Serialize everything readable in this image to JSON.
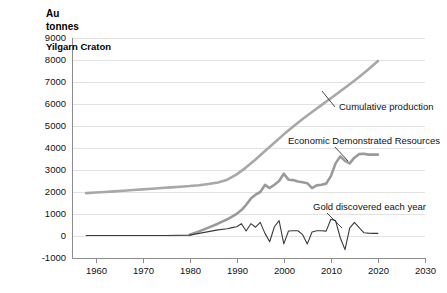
{
  "chart_data": {
    "type": "line",
    "title": "Au tonnes",
    "subtitle": "Yilgarn Craton",
    "xlabel": "",
    "ylabel": "Au tonnes",
    "xlim": [
      1955,
      2030
    ],
    "ylim": [
      -1000,
      9000
    ],
    "grid": true,
    "legend_position": "inline-annotations",
    "x_ticks": [
      1960,
      1970,
      1980,
      1990,
      2000,
      2010,
      2020,
      2030
    ],
    "y_ticks": [
      -1000,
      0,
      1000,
      2000,
      3000,
      4000,
      5000,
      6000,
      7000,
      8000,
      9000
    ],
    "series": [
      {
        "name": "Cumulative production",
        "color": "#a8a8a8",
        "width": 2.6,
        "annotation": "Cumulative production",
        "points": [
          [
            1958,
            1950
          ],
          [
            1960,
            1975
          ],
          [
            1962,
            2000
          ],
          [
            1964,
            2030
          ],
          [
            1966,
            2060
          ],
          [
            1968,
            2090
          ],
          [
            1970,
            2120
          ],
          [
            1972,
            2150
          ],
          [
            1974,
            2180
          ],
          [
            1976,
            2210
          ],
          [
            1978,
            2240
          ],
          [
            1980,
            2270
          ],
          [
            1982,
            2310
          ],
          [
            1984,
            2360
          ],
          [
            1986,
            2430
          ],
          [
            1988,
            2560
          ],
          [
            1990,
            2800
          ],
          [
            1992,
            3120
          ],
          [
            1994,
            3480
          ],
          [
            1996,
            3860
          ],
          [
            1998,
            4240
          ],
          [
            2000,
            4620
          ],
          [
            2002,
            4980
          ],
          [
            2004,
            5320
          ],
          [
            2006,
            5640
          ],
          [
            2008,
            5950
          ],
          [
            2010,
            6260
          ],
          [
            2012,
            6580
          ],
          [
            2014,
            6900
          ],
          [
            2016,
            7230
          ],
          [
            2018,
            7580
          ],
          [
            2020,
            7950
          ]
        ]
      },
      {
        "name": "Economic Demonstrated Resources",
        "color": "#9a9a9a",
        "width": 2.6,
        "annotation": "Economic Demonstrated Resources",
        "points": [
          [
            1980,
            60
          ],
          [
            1982,
            210
          ],
          [
            1984,
            380
          ],
          [
            1986,
            560
          ],
          [
            1988,
            760
          ],
          [
            1990,
            1010
          ],
          [
            1991,
            1180
          ],
          [
            1992,
            1420
          ],
          [
            1993,
            1700
          ],
          [
            1994,
            1880
          ],
          [
            1995,
            2000
          ],
          [
            1996,
            2320
          ],
          [
            1997,
            2180
          ],
          [
            1998,
            2330
          ],
          [
            1999,
            2500
          ],
          [
            2000,
            2830
          ],
          [
            2001,
            2560
          ],
          [
            2002,
            2540
          ],
          [
            2003,
            2480
          ],
          [
            2004,
            2440
          ],
          [
            2005,
            2400
          ],
          [
            2006,
            2180
          ],
          [
            2007,
            2300
          ],
          [
            2008,
            2330
          ],
          [
            2009,
            2380
          ],
          [
            2010,
            2720
          ],
          [
            2011,
            3300
          ],
          [
            2012,
            3620
          ],
          [
            2013,
            3420
          ],
          [
            2014,
            3300
          ],
          [
            2015,
            3560
          ],
          [
            2016,
            3720
          ],
          [
            2017,
            3740
          ],
          [
            2018,
            3700
          ],
          [
            2019,
            3700
          ],
          [
            2020,
            3700
          ]
        ]
      },
      {
        "name": "Gold discovered each year",
        "color": "#3a3a3a",
        "width": 1.1,
        "annotation": "Gold discovered each year",
        "points": [
          [
            1958,
            20
          ],
          [
            1965,
            20
          ],
          [
            1970,
            20
          ],
          [
            1975,
            20
          ],
          [
            1980,
            40
          ],
          [
            1982,
            120
          ],
          [
            1984,
            200
          ],
          [
            1986,
            280
          ],
          [
            1988,
            330
          ],
          [
            1989,
            380
          ],
          [
            1990,
            420
          ],
          [
            1991,
            560
          ],
          [
            1992,
            230
          ],
          [
            1993,
            560
          ],
          [
            1994,
            400
          ],
          [
            1995,
            620
          ],
          [
            1996,
            120
          ],
          [
            1997,
            -260
          ],
          [
            1998,
            420
          ],
          [
            1999,
            700
          ],
          [
            2000,
            -360
          ],
          [
            2001,
            230
          ],
          [
            2002,
            240
          ],
          [
            2003,
            240
          ],
          [
            2004,
            60
          ],
          [
            2005,
            -360
          ],
          [
            2006,
            180
          ],
          [
            2007,
            240
          ],
          [
            2008,
            240
          ],
          [
            2009,
            220
          ],
          [
            2010,
            760
          ],
          [
            2011,
            700
          ],
          [
            2012,
            -80
          ],
          [
            2013,
            -620
          ],
          [
            2014,
            360
          ],
          [
            2015,
            620
          ],
          [
            2016,
            380
          ],
          [
            2017,
            150
          ],
          [
            2018,
            130
          ],
          [
            2019,
            120
          ],
          [
            2020,
            120
          ]
        ]
      }
    ],
    "annotations": [
      {
        "label": "Cumulative production",
        "text_x": 339,
        "text_y": 110,
        "leader": [
          [
            335,
            107
          ],
          [
            322,
            91
          ]
        ]
      },
      {
        "label": "Economic Demonstrated Resources",
        "text_x": 288,
        "text_y": 144,
        "leader": [
          [
            335,
            147
          ],
          [
            348,
            161
          ]
        ]
      },
      {
        "label": "Gold discovered each year",
        "text_x": 313,
        "text_y": 210,
        "leader": [
          [
            327,
            213
          ],
          [
            342,
            228
          ]
        ]
      }
    ]
  }
}
